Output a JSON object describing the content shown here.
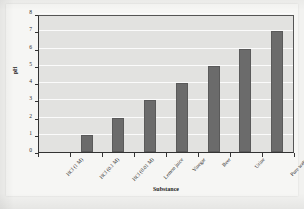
{
  "chart_data": {
    "type": "bar",
    "title": "",
    "xlabel": "Substance",
    "ylabel": "pH",
    "categories": [
      "HCl (1 M)",
      "HCl (0.1 M)",
      "HCl (0.01 M)",
      "Lemon juice",
      "Vinegar",
      "Beer",
      "Urine",
      "Pure water"
    ],
    "values": [
      0,
      1,
      2,
      3,
      4,
      5,
      6,
      7
    ],
    "ylim": [
      0,
      8
    ],
    "yticks": [
      0,
      1,
      2,
      3,
      4,
      5,
      6,
      7,
      8
    ],
    "ytick_labels": [
      "0",
      "1",
      "2",
      "3",
      "4",
      "5",
      "6",
      "7",
      "8"
    ],
    "grid": true,
    "legend": false,
    "orientation": "vertical",
    "bar_color": "#6b6b6b",
    "plot_background": "#e2e2e0",
    "gridline_color": "#fbfbfb",
    "axis_color": "#333333",
    "figure_background": "#f6f6f4",
    "page_background": "#f2f2f0"
  }
}
